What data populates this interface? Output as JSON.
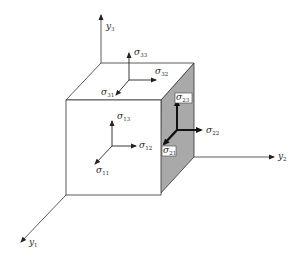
{
  "colors": {
    "line": "#333333",
    "shaded_face": "#a9a9a9",
    "background": "#ffffff"
  },
  "axes": [
    {
      "name": "y3",
      "symbol": "y",
      "subscript": "3"
    },
    {
      "name": "y2",
      "symbol": "y",
      "subscript": "2"
    },
    {
      "name": "y1",
      "symbol": "y",
      "subscript": "1"
    }
  ],
  "stress_labels": {
    "top_face": [
      {
        "name": "sigma33",
        "symbol": "σ",
        "subscript": "33"
      },
      {
        "name": "sigma32",
        "symbol": "σ",
        "subscript": "32"
      },
      {
        "name": "sigma31",
        "symbol": "σ",
        "subscript": "31"
      }
    ],
    "front_face": [
      {
        "name": "sigma13",
        "symbol": "σ",
        "subscript": "13"
      },
      {
        "name": "sigma12",
        "symbol": "σ",
        "subscript": "12"
      },
      {
        "name": "sigma11",
        "symbol": "σ",
        "subscript": "11"
      }
    ],
    "right_face": [
      {
        "name": "sigma23",
        "symbol": "σ",
        "subscript": "23"
      },
      {
        "name": "sigma22",
        "symbol": "σ",
        "subscript": "22"
      },
      {
        "name": "sigma21",
        "symbol": "σ",
        "subscript": "21"
      }
    ]
  }
}
